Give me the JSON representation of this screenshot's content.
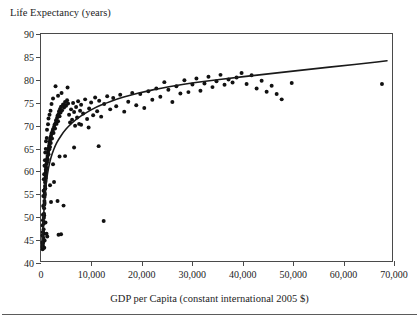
{
  "figure": {
    "y_axis_title": "Life Expectancy (years)",
    "x_axis_title": "GDP per Capita (constant international 2005 $)"
  },
  "chart_data": {
    "type": "scatter",
    "title": "",
    "ylabel": "Life Expectancy (years)",
    "xlabel": "GDP per Capita (constant international 2005 $)",
    "xlim": [
      0,
      70000
    ],
    "ylim": [
      40,
      90
    ],
    "xticks": [
      0,
      10000,
      20000,
      30000,
      40000,
      50000,
      60000,
      70000
    ],
    "xtick_labels": [
      "0",
      "10,000",
      "20,000",
      "30,000",
      "40,000",
      "50,000",
      "60,000",
      "70,000"
    ],
    "yticks": [
      40,
      45,
      50,
      55,
      60,
      65,
      70,
      75,
      80,
      85,
      90
    ],
    "ytick_labels": [
      "40",
      "45",
      "50",
      "55",
      "60",
      "65",
      "70",
      "75",
      "80",
      "85",
      "90"
    ],
    "grid": false,
    "legend": null,
    "marker_color": "#111111",
    "fit_color": "#1a1a1a",
    "fit_curve": {
      "name": "logarithmic fit",
      "points": [
        [
          250,
          43.0
        ],
        [
          400,
          47.5
        ],
        [
          600,
          51.5
        ],
        [
          800,
          54.5
        ],
        [
          1000,
          56.8
        ],
        [
          1300,
          59.3
        ],
        [
          1700,
          61.6
        ],
        [
          2200,
          63.6
        ],
        [
          2800,
          65.3
        ],
        [
          3500,
          66.8
        ],
        [
          4500,
          68.4
        ],
        [
          5500,
          69.7
        ],
        [
          7000,
          71.2
        ],
        [
          9000,
          72.7
        ],
        [
          11000,
          73.9
        ],
        [
          13000,
          74.8
        ],
        [
          15000,
          75.6
        ],
        [
          18000,
          76.6
        ],
        [
          21000,
          77.4
        ],
        [
          24000,
          78.1
        ],
        [
          27000,
          78.7
        ],
        [
          30000,
          79.2
        ],
        [
          34000,
          79.8
        ],
        [
          38000,
          80.3
        ],
        [
          42000,
          80.8
        ],
        [
          46000,
          81.3
        ],
        [
          50000,
          81.8
        ],
        [
          55000,
          82.4
        ],
        [
          60000,
          83.0
        ],
        [
          65000,
          83.6
        ],
        [
          69000,
          84.1
        ]
      ]
    },
    "points": [
      [
        300,
        43.1
      ],
      [
        330,
        42.6
      ],
      [
        360,
        43.4
      ],
      [
        420,
        44.0
      ],
      [
        450,
        45.1
      ],
      [
        470,
        46.2
      ],
      [
        500,
        44.8
      ],
      [
        520,
        47.0
      ],
      [
        540,
        46.0
      ],
      [
        560,
        48.3
      ],
      [
        580,
        49.5
      ],
      [
        600,
        50.4
      ],
      [
        620,
        51.6
      ],
      [
        640,
        50.0
      ],
      [
        660,
        52.4
      ],
      [
        680,
        53.2
      ],
      [
        700,
        54.1
      ],
      [
        720,
        52.8
      ],
      [
        740,
        55.0
      ],
      [
        760,
        55.8
      ],
      [
        780,
        54.6
      ],
      [
        800,
        56.5
      ],
      [
        820,
        57.3
      ],
      [
        840,
        56.0
      ],
      [
        860,
        58.1
      ],
      [
        880,
        57.6
      ],
      [
        900,
        58.8
      ],
      [
        920,
        59.4
      ],
      [
        940,
        58.3
      ],
      [
        960,
        60.1
      ],
      [
        980,
        59.8
      ],
      [
        1000,
        60.7
      ],
      [
        1050,
        61.3
      ],
      [
        1100,
        60.4
      ],
      [
        1150,
        62.0
      ],
      [
        1200,
        61.7
      ],
      [
        1250,
        62.6
      ],
      [
        1300,
        63.1
      ],
      [
        1350,
        62.3
      ],
      [
        1400,
        63.8
      ],
      [
        1450,
        64.3
      ],
      [
        1500,
        63.5
      ],
      [
        1550,
        64.9
      ],
      [
        1600,
        65.4
      ],
      [
        1650,
        64.6
      ],
      [
        1700,
        65.9
      ],
      [
        1750,
        66.3
      ],
      [
        1800,
        65.1
      ],
      [
        1850,
        66.8
      ],
      [
        1900,
        67.2
      ],
      [
        1950,
        66.0
      ],
      [
        2000,
        67.6
      ],
      [
        2100,
        68.1
      ],
      [
        2200,
        67.0
      ],
      [
        2300,
        68.6
      ],
      [
        2400,
        69.0
      ],
      [
        2500,
        68.2
      ],
      [
        2600,
        69.5
      ],
      [
        2700,
        70.0
      ],
      [
        2800,
        69.2
      ],
      [
        2900,
        70.4
      ],
      [
        3000,
        71.0
      ],
      [
        3100,
        70.2
      ],
      [
        3200,
        71.5
      ],
      [
        3300,
        72.0
      ],
      [
        3400,
        70.8
      ],
      [
        3500,
        72.4
      ],
      [
        3600,
        73.0
      ],
      [
        3700,
        71.9
      ],
      [
        3800,
        73.5
      ],
      [
        3900,
        72.7
      ],
      [
        4000,
        74.0
      ],
      [
        4200,
        73.2
      ],
      [
        4400,
        74.5
      ],
      [
        4600,
        73.8
      ],
      [
        4800,
        75.0
      ],
      [
        5000,
        74.2
      ],
      [
        5200,
        75.4
      ],
      [
        5400,
        74.7
      ],
      [
        5600,
        72.2
      ],
      [
        5800,
        70.5
      ],
      [
        6000,
        73.4
      ],
      [
        6200,
        71.1
      ],
      [
        6400,
        74.8
      ],
      [
        6600,
        72.8
      ],
      [
        6800,
        69.8
      ],
      [
        7000,
        73.9
      ],
      [
        7200,
        71.6
      ],
      [
        7400,
        75.2
      ],
      [
        7600,
        70.2
      ],
      [
        7800,
        73.1
      ],
      [
        8000,
        74.4
      ],
      [
        8400,
        72.5
      ],
      [
        8800,
        75.6
      ],
      [
        9200,
        71.3
      ],
      [
        9600,
        73.6
      ],
      [
        10000,
        74.9
      ],
      [
        10400,
        72.1
      ],
      [
        10800,
        76.0
      ],
      [
        11200,
        73.0
      ],
      [
        11600,
        75.3
      ],
      [
        12000,
        71.8
      ],
      [
        12600,
        74.6
      ],
      [
        13200,
        76.3
      ],
      [
        13800,
        73.4
      ],
      [
        14400,
        75.9
      ],
      [
        15000,
        74.1
      ],
      [
        15800,
        76.6
      ],
      [
        16600,
        72.9
      ],
      [
        17400,
        75.1
      ],
      [
        18200,
        77.0
      ],
      [
        19000,
        74.3
      ],
      [
        19800,
        76.8
      ],
      [
        20600,
        73.7
      ],
      [
        21400,
        77.4
      ],
      [
        22200,
        75.5
      ],
      [
        23000,
        78.0
      ],
      [
        23800,
        76.2
      ],
      [
        24600,
        79.4
      ],
      [
        25400,
        77.7
      ],
      [
        26200,
        75.0
      ],
      [
        27000,
        78.5
      ],
      [
        27800,
        76.9
      ],
      [
        28600,
        79.8
      ],
      [
        29400,
        77.2
      ],
      [
        30200,
        78.9
      ],
      [
        31000,
        80.2
      ],
      [
        31800,
        77.5
      ],
      [
        32600,
        79.1
      ],
      [
        33400,
        80.6
      ],
      [
        34200,
        78.3
      ],
      [
        35000,
        79.6
      ],
      [
        35800,
        81.0
      ],
      [
        36600,
        78.8
      ],
      [
        37400,
        80.0
      ],
      [
        38200,
        79.3
      ],
      [
        39000,
        80.4
      ],
      [
        40000,
        81.4
      ],
      [
        41000,
        79.0
      ],
      [
        42000,
        80.9
      ],
      [
        43000,
        78.0
      ],
      [
        44000,
        79.7
      ],
      [
        45000,
        77.3
      ],
      [
        46000,
        78.6
      ],
      [
        47000,
        76.8
      ],
      [
        48000,
        75.6
      ],
      [
        50000,
        79.2
      ],
      [
        68000,
        79.0
      ],
      [
        2400,
        75.8
      ],
      [
        2900,
        78.5
      ],
      [
        3400,
        76.4
      ],
      [
        4100,
        77.0
      ],
      [
        4700,
        74.3
      ],
      [
        5300,
        78.2
      ],
      [
        1900,
        73.1
      ],
      [
        2100,
        74.6
      ],
      [
        1500,
        71.4
      ],
      [
        1700,
        72.2
      ],
      [
        1200,
        68.9
      ],
      [
        1400,
        70.1
      ],
      [
        1000,
        66.4
      ],
      [
        1150,
        67.1
      ],
      [
        850,
        63.9
      ],
      [
        950,
        64.7
      ],
      [
        700,
        61.0
      ],
      [
        780,
        62.2
      ],
      [
        560,
        58.0
      ],
      [
        630,
        59.1
      ],
      [
        460,
        54.3
      ],
      [
        520,
        55.5
      ],
      [
        380,
        50.2
      ],
      [
        430,
        52.1
      ],
      [
        340,
        47.8
      ],
      [
        390,
        49.0
      ],
      [
        300,
        45.6
      ],
      [
        350,
        46.4
      ],
      [
        280,
        44.2
      ],
      [
        320,
        43.8
      ],
      [
        3700,
        63.0
      ],
      [
        4800,
        63.1
      ],
      [
        11500,
        65.3
      ],
      [
        12500,
        48.8
      ],
      [
        3300,
        53.2
      ],
      [
        4500,
        52.2
      ],
      [
        3500,
        45.8
      ],
      [
        4000,
        45.9
      ],
      [
        2400,
        61.3
      ],
      [
        1800,
        56.7
      ],
      [
        900,
        48.5
      ],
      [
        1100,
        46.0
      ],
      [
        1250,
        45.4
      ],
      [
        650,
        42.9
      ],
      [
        720,
        44.5
      ],
      [
        6600,
        65.0
      ],
      [
        8000,
        70.0
      ],
      [
        9500,
        69.4
      ],
      [
        2600,
        57.4
      ],
      [
        2000,
        53.0
      ]
    ]
  }
}
